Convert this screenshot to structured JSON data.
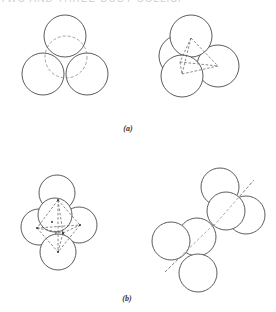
{
  "header": {
    "text": "TWO AND THREE-BODY COLLISIONS"
  },
  "colors": {
    "stroke": "#4a4a4a",
    "dashed": "#8a8a8a",
    "background": "#ffffff"
  },
  "figure": {
    "panels": [
      {
        "id": "a",
        "label": "(a)",
        "label_pos": [
          128,
          124
        ],
        "groups": [
          {
            "name": "three-spheres-with-dashed-fourth",
            "circles": [
              {
                "cx": 43,
                "cy": 74,
                "r": 21,
                "style": "solid"
              },
              {
                "cx": 87,
                "cy": 74,
                "r": 21,
                "style": "solid"
              },
              {
                "cx": 66,
                "cy": 57,
                "r": 21,
                "style": "dashed"
              },
              {
                "cx": 65,
                "cy": 36,
                "r": 21,
                "style": "solid",
                "occludes_dashed": true
              }
            ]
          },
          {
            "name": "tetrahedral-four-spheres",
            "circles": [
              {
                "cx": 180,
                "cy": 56,
                "r": 21,
                "style": "solid"
              },
              {
                "cx": 218,
                "cy": 66,
                "r": 21,
                "style": "solid"
              },
              {
                "cx": 191,
                "cy": 36,
                "r": 21,
                "style": "solid"
              },
              {
                "cx": 182,
                "cy": 76,
                "r": 21,
                "style": "solid"
              }
            ],
            "dashed_lines": [
              [
                [
                  191,
                  38
                ],
                [
                  218,
                  66
                ]
              ],
              [
                [
                  218,
                  66
                ],
                [
                  182,
                  74
                ]
              ],
              [
                [
                  191,
                  38
                ],
                [
                  182,
                  74
                ]
              ],
              [
                [
                  191,
                  38
                ],
                [
                  180,
                  62
                ]
              ],
              [
                [
                  180,
                  62
                ],
                [
                  218,
                  66
                ]
              ],
              [
                [
                  180,
                  62
                ],
                [
                  182,
                  74
                ]
              ]
            ]
          }
        ]
      },
      {
        "id": "b",
        "label": "(b)",
        "label_pos": [
          127,
          294
        ],
        "groups": [
          {
            "name": "octahedral-six-spheres",
            "circles": [
              {
                "cx": 57,
                "cy": 193,
                "r": 18,
                "style": "solid"
              },
              {
                "cx": 39,
                "cy": 227,
                "r": 18,
                "style": "solid"
              },
              {
                "cx": 79,
                "cy": 225,
                "r": 18,
                "style": "solid"
              },
              {
                "cx": 58,
                "cy": 252,
                "r": 18,
                "style": "solid"
              },
              {
                "cx": 55,
                "cy": 215,
                "r": 17,
                "style": "solid"
              }
            ],
            "dashed_lines": [
              [
                [
                  58,
                  200
                ],
                [
                  37,
                  228
                ]
              ],
              [
                [
                  58,
                  200
                ],
                [
                  80,
                  225
                ]
              ],
              [
                [
                  58,
                  200
                ],
                [
                  58,
                  252
                ]
              ],
              [
                [
                  58,
                  200
                ],
                [
                  63,
                  233
                ]
              ],
              [
                [
                  37,
                  228
                ],
                [
                  63,
                  233
                ]
              ],
              [
                [
                  63,
                  233
                ],
                [
                  80,
                  225
                ]
              ],
              [
                [
                  37,
                  228
                ],
                [
                  58,
                  252
                ]
              ],
              [
                [
                  80,
                  225
                ],
                [
                  58,
                  252
                ]
              ],
              [
                [
                  63,
                  233
                ],
                [
                  58,
                  252
                ]
              ],
              [
                [
                  37,
                  228
                ],
                [
                  80,
                  225
                ]
              ]
            ],
            "points": [
              [
                58,
                200
              ],
              [
                37,
                228
              ],
              [
                80,
                225
              ],
              [
                58,
                252
              ],
              [
                63,
                233
              ],
              [
                52,
                222
              ]
            ]
          },
          {
            "name": "linear-three-sphere-upper",
            "circles": [
              {
                "cx": 246,
                "cy": 215,
                "r": 19,
                "style": "solid"
              },
              {
                "cx": 220,
                "cy": 187,
                "r": 19,
                "style": "solid"
              },
              {
                "cx": 226,
                "cy": 211,
                "r": 19,
                "style": "solid"
              }
            ],
            "axis": [
              [
                210,
                230
              ],
              [
                254,
                180
              ]
            ]
          },
          {
            "name": "linear-three-sphere-lower",
            "circles": [
              {
                "cx": 197,
                "cy": 237,
                "r": 19,
                "style": "solid"
              },
              {
                "cx": 171,
                "cy": 241,
                "r": 19,
                "style": "solid"
              },
              {
                "cx": 198,
                "cy": 273,
                "r": 19,
                "style": "solid"
              }
            ],
            "axis": [
              [
                165,
                272
              ],
              [
                214,
                224
              ]
            ]
          }
        ]
      }
    ]
  }
}
